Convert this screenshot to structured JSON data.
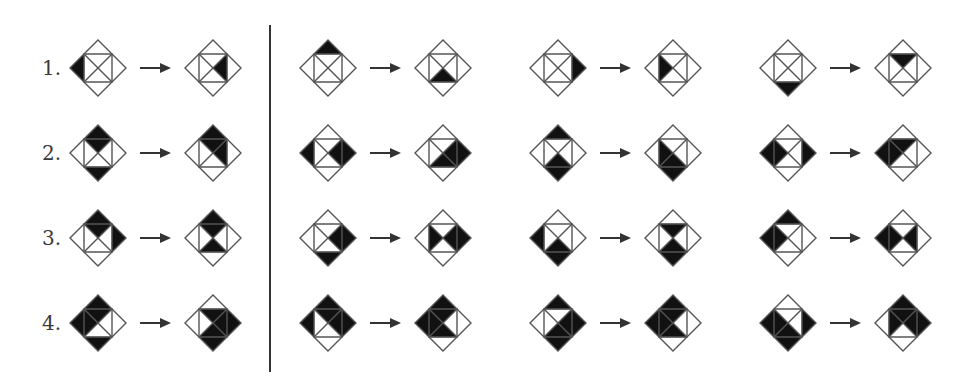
{
  "figure": {
    "row_labels": [
      "1.",
      "2.",
      "3.",
      "4."
    ],
    "region_legend": {
      "T": "outer top triangle",
      "R": "outer right triangle",
      "B": "outer bottom triangle",
      "L": "outer left triangle",
      "t": "inner top quadrant",
      "r": "inner right quadrant",
      "b": "inner bottom quadrant",
      "l": "inner left quadrant"
    },
    "fill_color": "#111111",
    "line_color": "#555555",
    "rows": [
      {
        "label": "1.",
        "rules": [
          {
            "from": [
              "L"
            ],
            "to": [
              "r"
            ]
          },
          {
            "from": [
              "T"
            ],
            "to": [
              "b"
            ]
          },
          {
            "from": [
              "R"
            ],
            "to": [
              "l"
            ]
          },
          {
            "from": [
              "B"
            ],
            "to": [
              "t"
            ]
          }
        ]
      },
      {
        "label": "2.",
        "rules": [
          {
            "from": [
              "T",
              "t",
              "B"
            ],
            "to": [
              "T",
              "t",
              "r"
            ]
          },
          {
            "from": [
              "L",
              "r",
              "R"
            ],
            "to": [
              "R",
              "r",
              "b"
            ]
          },
          {
            "from": [
              "T",
              "b",
              "B"
            ],
            "to": [
              "B",
              "b",
              "l"
            ]
          },
          {
            "from": [
              "L",
              "l",
              "R"
            ],
            "to": [
              "L",
              "l",
              "t"
            ]
          }
        ]
      },
      {
        "label": "3.",
        "rules": [
          {
            "from": [
              "T",
              "t",
              "R"
            ],
            "to": [
              "T",
              "t",
              "b"
            ]
          },
          {
            "from": [
              "R",
              "r",
              "B"
            ],
            "to": [
              "R",
              "r",
              "l"
            ]
          },
          {
            "from": [
              "L",
              "b",
              "B"
            ],
            "to": [
              "B",
              "b",
              "t"
            ]
          },
          {
            "from": [
              "L",
              "l",
              "T"
            ],
            "to": [
              "L",
              "l",
              "r"
            ]
          }
        ]
      },
      {
        "label": "4.",
        "rules": [
          {
            "from": [
              "T",
              "t",
              "L",
              "l",
              "B"
            ],
            "to": [
              "t",
              "r",
              "R",
              "b",
              "B"
            ]
          },
          {
            "from": [
              "T",
              "t",
              "L",
              "r",
              "R"
            ],
            "to": [
              "T",
              "t",
              "L",
              "l",
              "b"
            ]
          },
          {
            "from": [
              "T",
              "R",
              "r",
              "b",
              "B"
            ],
            "to": [
              "T",
              "L",
              "l",
              "t",
              "b"
            ]
          },
          {
            "from": [
              "L",
              "l",
              "b",
              "R",
              "B"
            ],
            "to": [
              "T",
              "l",
              "t",
              "r",
              "R"
            ]
          }
        ]
      }
    ]
  }
}
